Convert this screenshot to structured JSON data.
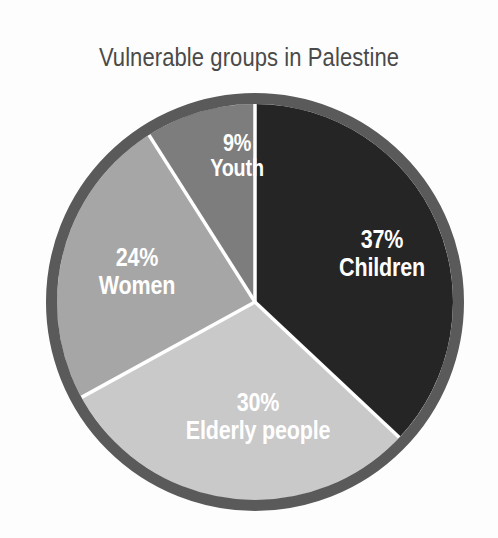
{
  "chart_data": {
    "type": "pie",
    "title": "Vulnerable groups in Palestine",
    "subtitle": "",
    "xlabel": "",
    "ylabel": "",
    "legend": "none",
    "grid": false,
    "units": "percent",
    "categories": [
      "Children",
      "Elderly people",
      "Women",
      "Youth"
    ],
    "values": [
      37,
      30,
      24,
      9
    ],
    "slices": [
      {
        "label": "Children",
        "value": 37,
        "value_text": "37%",
        "color": "#252525",
        "start_angle_deg": 0,
        "end_angle_deg": 133.2
      },
      {
        "label": "Elderly people",
        "value": 30,
        "value_text": "30%",
        "color": "#c9c9c9",
        "start_angle_deg": 133.2,
        "end_angle_deg": 241.2
      },
      {
        "label": "Women",
        "value": 24,
        "value_text": "24%",
        "color": "#a6a6a6",
        "start_angle_deg": 241.2,
        "end_angle_deg": 327.6
      },
      {
        "label": "Youth",
        "value": 9,
        "value_text": "9%",
        "color": "#7d7d7d",
        "start_angle_deg": 327.6,
        "end_angle_deg": 360
      }
    ]
  },
  "chart": {
    "title": "Vulnerable groups in Palestine",
    "background": "#fdfdfd",
    "title_color": "#4a4a4a",
    "ring_color": "#5a5a5a",
    "divider_color": "#ffffff",
    "label_color": "#ffffff",
    "center_x": 255,
    "center_y": 302,
    "radius": 198,
    "ring_width": 11,
    "start_angle_deg": 0,
    "direction": "clockwise"
  },
  "labels": {
    "children": {
      "percent": "37%",
      "name": "Children"
    },
    "elderly": {
      "percent": "30%",
      "name": "Elderly people"
    },
    "women": {
      "percent": "24%",
      "name": "Women"
    },
    "youth": {
      "percent": "9%",
      "name": "Youth"
    }
  }
}
